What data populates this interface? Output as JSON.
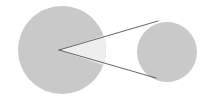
{
  "canvas": {
    "width": 215,
    "height": 102,
    "background": "#ffffff",
    "title": "two-circle tangent wedge diagram"
  },
  "chart_data": {
    "type": "diagram",
    "title": "",
    "xlabel": "",
    "ylabel": "",
    "shapes": [
      {
        "name": "large-circle",
        "type": "circle",
        "cx": 62,
        "cy": 50,
        "r": 44,
        "fill": "#c9c9c9",
        "stroke": "none"
      },
      {
        "name": "small-circle",
        "type": "circle",
        "cx": 167,
        "cy": 52,
        "r": 30,
        "fill": "#c9c9c9",
        "stroke": "none"
      },
      {
        "name": "wedge",
        "type": "polygon",
        "points": "59,50 161,17 159,84",
        "fill": "#eeeeee",
        "stroke": "none",
        "clip": "large-circle"
      },
      {
        "name": "tangent-line-upper",
        "type": "line",
        "x1": 59,
        "y1": 50,
        "x2": 158,
        "y2": 21,
        "stroke": "#555555",
        "stroke_width": 0.9
      },
      {
        "name": "tangent-line-lower",
        "type": "line",
        "x1": 59,
        "y1": 50,
        "x2": 156,
        "y2": 78,
        "stroke": "#555555",
        "stroke_width": 0.9
      }
    ],
    "colors": {
      "disc_fill": "#c9c9c9",
      "wedge_fill": "#eeeeee",
      "line_stroke": "#555555",
      "background": "#ffffff"
    },
    "annotations": [],
    "legend": []
  }
}
